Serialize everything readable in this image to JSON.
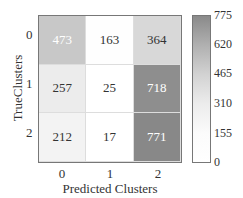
{
  "chart_data": {
    "type": "heatmap",
    "title": "",
    "xlabel": "Predicted Clusters",
    "ylabel": "TrueClusters",
    "x_categories": [
      "0",
      "1",
      "2"
    ],
    "y_categories": [
      "0",
      "1",
      "2"
    ],
    "values": [
      [
        473,
        163,
        364
      ],
      [
        257,
        25,
        718
      ],
      [
        212,
        17,
        771
      ]
    ],
    "colorbar": {
      "ticks": [
        "775",
        "620",
        "465",
        "310",
        "155",
        "0"
      ],
      "range": [
        0,
        775
      ],
      "colormap": "greys"
    }
  },
  "cells": [
    {
      "v": "473",
      "bg": "#c8c8c8",
      "fg": "#ffffff"
    },
    {
      "v": "163",
      "bg": "#fefefe",
      "fg": "#333333"
    },
    {
      "v": "364",
      "bg": "#d8d8d8",
      "fg": "#333333"
    },
    {
      "v": "257",
      "bg": "#ececec",
      "fg": "#333333"
    },
    {
      "v": "25",
      "bg": "#ffffff",
      "fg": "#333333"
    },
    {
      "v": "718",
      "bg": "#8e8e8e",
      "fg": "#ffffff"
    },
    {
      "v": "212",
      "bg": "#f3f3f3",
      "fg": "#333333"
    },
    {
      "v": "17",
      "bg": "#ffffff",
      "fg": "#333333"
    },
    {
      "v": "771",
      "bg": "#888888",
      "fg": "#ffffff"
    }
  ]
}
